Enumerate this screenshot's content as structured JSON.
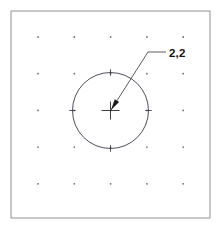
{
  "drawing": {
    "title": "grid-circle-coordinate-callout",
    "background_color": "#ffffff",
    "frame": {
      "name": "drawing-border",
      "x": 11,
      "y": 11,
      "width": 199,
      "height": 207,
      "stroke_color": "#9a9a9a"
    },
    "grid": {
      "name": "snap-grid",
      "columns": 5,
      "rows": 5,
      "origin_x": 38,
      "origin_y": 37,
      "spacing_x": 36.3,
      "spacing_y": 36.7,
      "dot_radius": 0.9,
      "dot_color": "#6f6f6f"
    },
    "circle": {
      "name": "drawn-circle",
      "center_x": 110.5,
      "center_y": 110.5,
      "radius": 38,
      "stroke_color": "#3a3a4a",
      "quadrant_ticks": true
    },
    "center_marker": {
      "name": "center-crosshair",
      "x": 110.5,
      "y": 110.5,
      "arm_length": 9,
      "color": "#2b2b2b"
    },
    "leader": {
      "name": "coordinate-leader",
      "arrow_x": 111,
      "arrow_y": 110,
      "elbow_x": 148,
      "elbow_y": 52,
      "end_x": 166,
      "end_y": 52,
      "stroke_color": "#4a4a55"
    },
    "label": {
      "name": "coordinate-label",
      "text": "2,2",
      "x": 169,
      "y": 57,
      "color": "#111111"
    }
  }
}
